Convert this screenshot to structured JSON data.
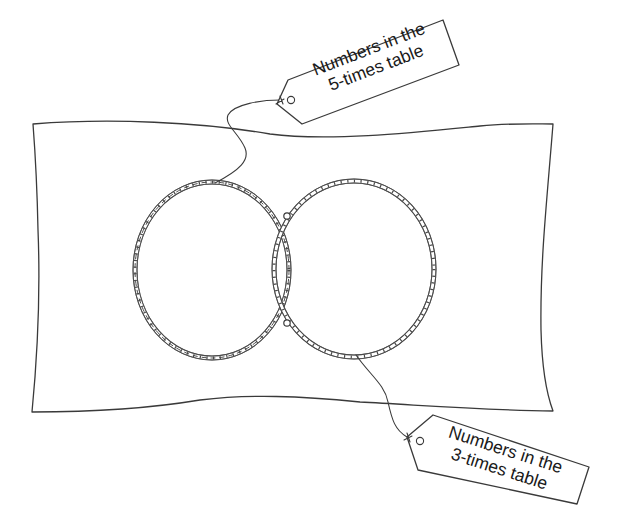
{
  "diagram": {
    "colors": {
      "line": "#3a3a3a",
      "rope": "#4a4a4a",
      "background": "#ffffff",
      "text": "#1a1a1a"
    },
    "sets": [
      {
        "id": "five",
        "hoop": "left",
        "tag": {
          "line1": "Numbers in the",
          "line2": "5-times table"
        }
      },
      {
        "id": "three",
        "hoop": "right",
        "tag": {
          "line1": "Numbers in the",
          "line2": "3-times table"
        }
      }
    ],
    "regions": [
      "only-5-times",
      "both",
      "only-3-times",
      "outside"
    ]
  }
}
